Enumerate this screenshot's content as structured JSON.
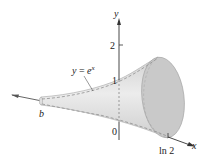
{
  "figure": {
    "type": "solid-of-revolution",
    "curve_label": {
      "lhs": "y",
      "eq": " = ",
      "base": "e",
      "exp": "x"
    },
    "axes": {
      "x_label": "x",
      "y_label": "y",
      "y_ticks": [
        "2",
        "1"
      ],
      "origin_label": "0",
      "x_right_label": "ln 2",
      "x_left_label": "b"
    },
    "colors": {
      "solid_fill": "#d9d9d9",
      "disk_fill": "#c8c8c8",
      "edge": "#a8a8a8",
      "axis": "#333333",
      "dashed_curve": "#9a9a9a"
    }
  }
}
